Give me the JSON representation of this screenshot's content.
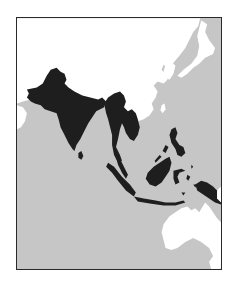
{
  "map": {
    "region": "South and Southeast Asia",
    "colors": {
      "sea": "#c6c6c6",
      "land": "#ffffff",
      "highlighted": "#1e1e1e",
      "frame": "#2a2a2a"
    },
    "highlighted_regions": [
      "Pakistan",
      "India",
      "Nepal",
      "Bangladesh",
      "Sri Lanka",
      "Myanmar",
      "Thailand",
      "Laos",
      "Cambodia",
      "Vietnam",
      "Malaysia",
      "Indonesia",
      "Philippines",
      "Papua New Guinea"
    ],
    "unhighlighted_land": [
      "China",
      "Mongolia",
      "Korea",
      "Japan",
      "Australia",
      "Arabian Peninsula"
    ]
  }
}
